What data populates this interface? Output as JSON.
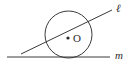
{
  "figure": {
    "canvas": {
      "width": 130,
      "height": 69,
      "background": "#ffffff"
    },
    "stroke_color": "#3a3a3a",
    "label_color": "#2b2b2b",
    "circle": {
      "name": "circle-O",
      "center_x": 68.5,
      "center_y": 34.5,
      "radius": 23.5
    },
    "center_point": {
      "label": "O",
      "dot_x": 68,
      "dot_y": 38,
      "dot_radius": 1.6,
      "label_x": 73,
      "label_y": 41.5
    },
    "secant_line": {
      "label": "ℓ",
      "x1": 21,
      "y1": 54,
      "x2": 112,
      "y2": 10,
      "label_x": 116,
      "label_y": 12
    },
    "tangent_line": {
      "label": "m",
      "x1": 7,
      "y1": 57,
      "x2": 110,
      "y2": 57,
      "label_x": 115,
      "label_y": 59
    }
  }
}
